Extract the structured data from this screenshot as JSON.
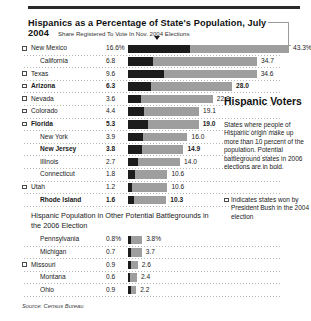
{
  "header": {
    "title": "Hispanics as a Percentage of State's Population, July 2004",
    "subtitle": "Share Registered To Vote In Nov. 2004 Elections"
  },
  "right_column": {
    "title": "Hispanic Voters",
    "body": "States where people of Hispanic origin make up more than 10 percent of the population. Potential battleground states in 2006 elections are in bold.",
    "legend": "Indicates states won by President Bush in the 2004 election"
  },
  "section2": {
    "heading": "Hispanic Population in Other Potential Battlegrounds in the 2006 Election"
  },
  "source": "Source: Census Bureau",
  "colors": {
    "bar_registered": "#1c1c1c",
    "bar_population": "#9e9e9e",
    "rule": "#2a2a2a",
    "text": "#1a1a1a"
  },
  "chart_data": {
    "type": "bar",
    "title": "Hispanics as a Percentage of State's Population, July 2004",
    "subtitle": "Share Registered To Vote In Nov. 2004 Elections",
    "xlabel": "",
    "ylabel": "",
    "xlim": [
      0,
      45
    ],
    "grid": false,
    "legend": [
      "Share Registered To Vote In Nov. 2004 Elections",
      "Hispanic Percentage of State Population"
    ],
    "series": [
      {
        "name": "Share Registered To Vote In Nov. 2004 Elections",
        "key": "registered"
      },
      {
        "name": "Hispanic Percentage of State Population",
        "key": "population"
      }
    ],
    "panels": [
      {
        "name": "Hispanics as a Percentage of State's Population, July 2004",
        "rows": [
          {
            "state": "New Mexico",
            "registered": "16.6%",
            "registered_value": 16.6,
            "population": "43.3%",
            "population_value": 43.3,
            "bush": true,
            "bold": false
          },
          {
            "state": "California",
            "registered": "6.8",
            "registered_value": 6.8,
            "population": "34.7",
            "population_value": 34.7,
            "bush": false,
            "bold": false
          },
          {
            "state": "Texas",
            "registered": "9.6",
            "registered_value": 9.6,
            "population": "34.6",
            "population_value": 34.6,
            "bush": true,
            "bold": false
          },
          {
            "state": "Arizona",
            "registered": "6.3",
            "registered_value": 6.3,
            "population": "28.0",
            "population_value": 28.0,
            "bush": true,
            "bold": true
          },
          {
            "state": "Nevada",
            "registered": "3.6",
            "registered_value": 3.6,
            "population": "22.8",
            "population_value": 22.8,
            "bush": true,
            "bold": false
          },
          {
            "state": "Colorado",
            "registered": "4.4",
            "registered_value": 4.4,
            "population": "19.1",
            "population_value": 19.1,
            "bush": true,
            "bold": false
          },
          {
            "state": "Florida",
            "registered": "5.3",
            "registered_value": 5.3,
            "population": "19.0",
            "population_value": 19.0,
            "bush": true,
            "bold": true
          },
          {
            "state": "New York",
            "registered": "3.9",
            "registered_value": 3.9,
            "population": "16.0",
            "population_value": 16.0,
            "bush": false,
            "bold": false
          },
          {
            "state": "New Jersey",
            "registered": "3.8",
            "registered_value": 3.8,
            "population": "14.9",
            "population_value": 14.9,
            "bush": false,
            "bold": true
          },
          {
            "state": "Illinois",
            "registered": "2.7",
            "registered_value": 2.7,
            "population": "14.0",
            "population_value": 14.0,
            "bush": false,
            "bold": false
          },
          {
            "state": "Connecticut",
            "registered": "1.8",
            "registered_value": 1.8,
            "population": "10.6",
            "population_value": 10.6,
            "bush": false,
            "bold": false
          },
          {
            "state": "Utah",
            "registered": "1.2",
            "registered_value": 1.2,
            "population": "10.6",
            "population_value": 10.6,
            "bush": true,
            "bold": false
          },
          {
            "state": "Rhode Island",
            "registered": "1.6",
            "registered_value": 1.6,
            "population": "10.3",
            "population_value": 10.3,
            "bush": false,
            "bold": true
          }
        ]
      },
      {
        "name": "Hispanic Population in Other Potential Battlegrounds in the 2006 Election",
        "rows": [
          {
            "state": "Pennsylvania",
            "registered": "0.8%",
            "registered_value": 0.8,
            "population": "3.8%",
            "population_value": 3.8,
            "bush": false,
            "bold": false
          },
          {
            "state": "Michigan",
            "registered": "0.7",
            "registered_value": 0.7,
            "population": "3.7",
            "population_value": 3.7,
            "bush": false,
            "bold": false
          },
          {
            "state": "Missouri",
            "registered": "0.9",
            "registered_value": 0.9,
            "population": "2.6",
            "population_value": 2.6,
            "bush": true,
            "bold": false
          },
          {
            "state": "Montana",
            "registered": "0.6",
            "registered_value": 0.6,
            "population": "2.4",
            "population_value": 2.4,
            "bush": false,
            "bold": false
          },
          {
            "state": "Ohio",
            "registered": "0.9",
            "registered_value": 0.9,
            "population": "2.2",
            "population_value": 2.2,
            "bush": false,
            "bold": false
          }
        ]
      }
    ]
  }
}
